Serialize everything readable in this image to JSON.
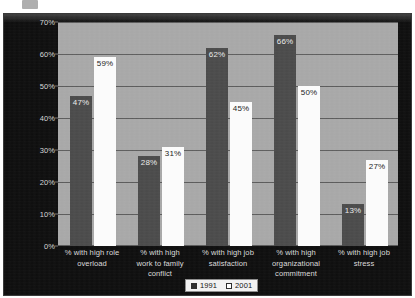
{
  "chart_data": {
    "type": "bar",
    "title": "",
    "subtitle": "",
    "xlabel": "",
    "ylabel": "",
    "ylim": [
      0,
      70
    ],
    "ytick_labels": [
      "70%",
      "60%",
      "50%",
      "40%",
      "30%",
      "20%",
      "10%",
      "0%"
    ],
    "ytick_values": [
      70,
      60,
      50,
      40,
      30,
      20,
      10,
      0
    ],
    "grid": true,
    "legend_position": "bottom",
    "categories": [
      "% with high role overload",
      "% with high work to family conflict",
      "% with high job satisfaction",
      "% with high organizational commitment",
      "% with high job stress"
    ],
    "category_lines": [
      [
        "% with high role",
        "overload"
      ],
      [
        "% with high",
        "work to family",
        "conflict"
      ],
      [
        "% with high job",
        "satisfaction"
      ],
      [
        "% with high",
        "organizational",
        "commitment"
      ],
      [
        "% with high job",
        "stress"
      ]
    ],
    "series": [
      {
        "name": "1991",
        "color": "#4a4a4a",
        "swatch": "filled",
        "values": [
          47,
          28,
          62,
          66,
          13
        ],
        "value_labels": [
          "47%",
          "28%",
          "62%",
          "66%",
          "13%"
        ]
      },
      {
        "name": "2001",
        "color": "#fbfbfb",
        "swatch": "hollow",
        "values": [
          59,
          31,
          45,
          50,
          27
        ],
        "value_labels": [
          "59%",
          "31%",
          "45%",
          "50%",
          "27%"
        ]
      }
    ]
  },
  "legend": {
    "items": [
      {
        "label": "1991",
        "swatch": "filled"
      },
      {
        "label": "2001",
        "swatch": "hollow"
      }
    ]
  },
  "colors": {
    "background": "#0d0d0d",
    "plot_background": "#a8a8a8",
    "gridline": "#5c5c5c",
    "series_1991": "#4a4a4a",
    "series_2001": "#fbfbfb",
    "axis_text": "#d8d8d8"
  }
}
